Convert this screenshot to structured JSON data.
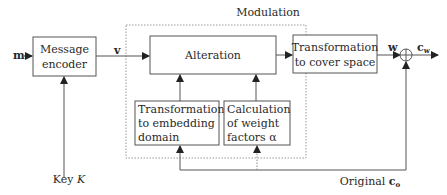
{
  "diagram": {
    "group_label": "Modulation",
    "blocks": {
      "message_encoder": [
        "Message",
        "encoder"
      ],
      "alteration": [
        "Alteration"
      ],
      "transform_cover": [
        "Transformation",
        "to cover space"
      ],
      "transform_embed": [
        "Transformation",
        "to embedding",
        "domain"
      ],
      "weight_calc": [
        "Calculation",
        "of weight",
        "factors α"
      ]
    },
    "signals": {
      "input": "m",
      "encoded": "v",
      "watermark": "w",
      "output": "c",
      "output_sub": "w",
      "original": "Original ",
      "original_var": "c",
      "original_sub": "o",
      "key": "Key ",
      "key_var": "K"
    },
    "adder_symbol": "⊕"
  }
}
